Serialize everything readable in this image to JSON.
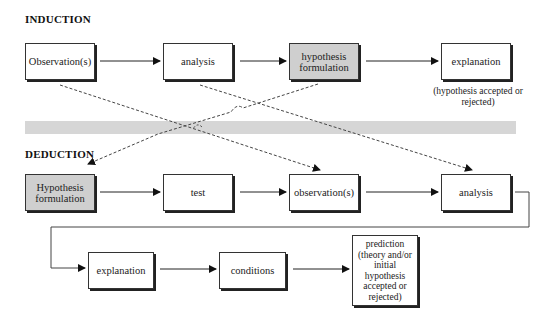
{
  "induction": {
    "heading": "INDUCTION",
    "steps": [
      {
        "label": "Observation(s)",
        "highlighted": false
      },
      {
        "label": "analysis",
        "highlighted": false
      },
      {
        "label": "hypothesis formulation",
        "highlighted": true
      },
      {
        "label": "explanation",
        "highlighted": false
      }
    ],
    "note": "(hypothesis accepted or rejected)"
  },
  "deduction": {
    "heading": "DEDUCTION",
    "steps": [
      {
        "label": "Hypothesis formulation",
        "highlighted": true
      },
      {
        "label": "test",
        "highlighted": false
      },
      {
        "label": "observation(s)",
        "highlighted": false
      },
      {
        "label": "analysis",
        "highlighted": false
      },
      {
        "label": "explanation",
        "highlighted": false
      },
      {
        "label": "conditions",
        "highlighted": false
      },
      {
        "label": "prediction (theory and/or initial hypothesis accepted or rejected)",
        "highlighted": false
      }
    ]
  },
  "cross_links": [
    {
      "from": "induction: Observation(s)",
      "to": "deduction: observation(s)",
      "style": "dashed"
    },
    {
      "from": "induction: analysis",
      "to": "deduction: analysis",
      "style": "dashed"
    },
    {
      "from": "induction: hypothesis formulation",
      "to": "deduction: Hypothesis formulation",
      "style": "dashed"
    }
  ],
  "colors": {
    "highlight_fill": "#cfcfcf",
    "band_fill": "#d6d6d6",
    "line": "#222222"
  }
}
